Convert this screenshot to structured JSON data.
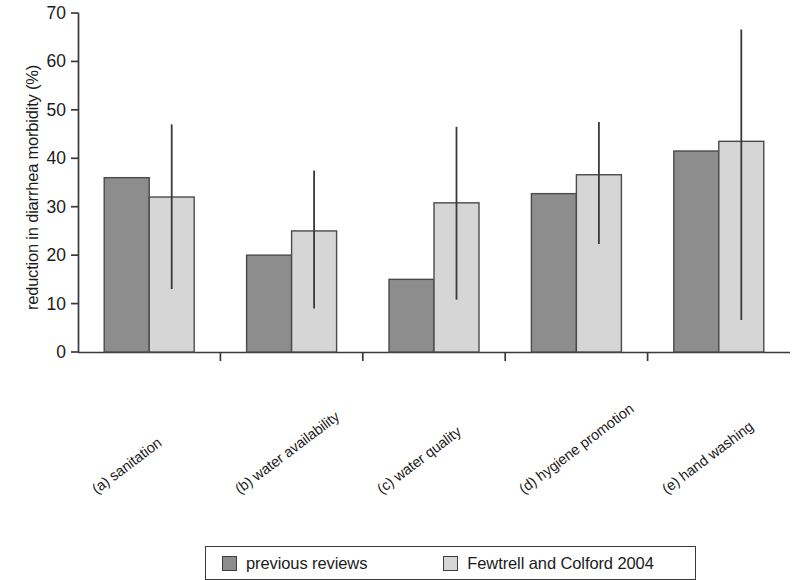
{
  "chart_data": {
    "type": "bar",
    "title": "",
    "subtitle": "",
    "xlabel": "",
    "ylabel": "reduction in diarrhea morbidity (%)",
    "ylim": [
      0,
      70
    ],
    "ytick_labels": [
      "0",
      "10",
      "20",
      "30",
      "40",
      "50",
      "60",
      "70"
    ],
    "ytick_values": [
      0,
      10,
      20,
      30,
      40,
      50,
      60,
      70
    ],
    "grid": false,
    "legend_position": "bottom",
    "categories": [
      "(a) sanitation",
      "(b) water availability",
      "(c) water quality",
      "(d) hygiene promotion",
      "(e) hand washing"
    ],
    "series": [
      {
        "name": "previous reviews",
        "color": "#8d8d8d",
        "values": [
          36,
          20,
          15,
          32.7,
          41.5
        ],
        "errors": [
          null,
          null,
          null,
          null,
          null
        ]
      },
      {
        "name": "Fewtrell and Colford 2004",
        "color": "#d6d6d6",
        "values": [
          32,
          25,
          30.8,
          36.6,
          43.5
        ],
        "errors": [
          {
            "low": 13,
            "high": 47
          },
          {
            "low": 9,
            "high": 37.5
          },
          {
            "low": 10.8,
            "high": 46.5
          },
          {
            "low": 22.3,
            "high": 47.5
          },
          {
            "low": 6.6,
            "high": 66.6
          }
        ]
      }
    ]
  },
  "legend": {
    "entries": [
      {
        "label": "previous reviews",
        "color": "#8d8d8d"
      },
      {
        "label": "Fewtrell and Colford 2004",
        "color": "#d6d6d6"
      }
    ]
  }
}
